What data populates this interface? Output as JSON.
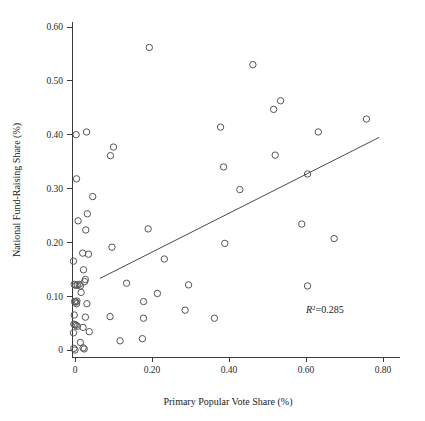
{
  "chart_data": {
    "type": "scatter",
    "title": "",
    "subtitle": "",
    "xlabel": "Primary Popular Vote Share (%)",
    "ylabel": "National Fund-Raising Share (%)",
    "xlim": [
      -0.035,
      0.82
    ],
    "ylim": [
      -0.022,
      0.625
    ],
    "grid": false,
    "legend": null,
    "xticks": [
      0,
      0.2,
      0.4,
      0.6,
      0.8
    ],
    "xtick_labels": [
      "0",
      "0.20",
      "0.40",
      "0.60",
      "0.80"
    ],
    "yticks": [
      0,
      0.1,
      0.2,
      0.3,
      0.4,
      0.5,
      0.6
    ],
    "ytick_labels": [
      "0",
      "0.10",
      "0.20",
      "0.30",
      "0.40",
      "0.50",
      "0.60"
    ],
    "annotations": [
      {
        "name": "r-squared",
        "text_prefix": "R",
        "text_superscript": "2",
        "text_suffix": "=0.285",
        "full_text": "R2=0.285",
        "x": 0.6,
        "y": 0.068
      }
    ],
    "trendline": {
      "type": "linear-fit",
      "r_squared": 0.285,
      "x_start": 0.065,
      "y_start": 0.133,
      "x_end": 0.79,
      "y_end": 0.395
    },
    "marker": {
      "shape": "open-circle",
      "radius_px": 3.2,
      "stroke": "#555555",
      "fill": "none"
    },
    "points": [
      {
        "x": 0.003,
        "y": 0.4
      },
      {
        "x": 0.03,
        "y": 0.405
      },
      {
        "x": 0.193,
        "y": 0.562
      },
      {
        "x": 0.462,
        "y": 0.53
      },
      {
        "x": 0.516,
        "y": 0.447
      },
      {
        "x": 0.534,
        "y": 0.463
      },
      {
        "x": 0.378,
        "y": 0.414
      },
      {
        "x": 0.632,
        "y": 0.405
      },
      {
        "x": 0.757,
        "y": 0.429
      },
      {
        "x": 0.52,
        "y": 0.362
      },
      {
        "x": 0.386,
        "y": 0.34
      },
      {
        "x": 0.604,
        "y": 0.327
      },
      {
        "x": 0.428,
        "y": 0.298
      },
      {
        "x": 0.092,
        "y": 0.361
      },
      {
        "x": 0.1,
        "y": 0.377
      },
      {
        "x": 0.004,
        "y": 0.318
      },
      {
        "x": 0.046,
        "y": 0.285
      },
      {
        "x": 0.032,
        "y": 0.253
      },
      {
        "x": 0.008,
        "y": 0.24
      },
      {
        "x": 0.028,
        "y": 0.223
      },
      {
        "x": 0.19,
        "y": 0.225
      },
      {
        "x": 0.589,
        "y": 0.234
      },
      {
        "x": 0.673,
        "y": 0.207
      },
      {
        "x": 0.389,
        "y": 0.198
      },
      {
        "x": 0.096,
        "y": 0.191
      },
      {
        "x": 0.02,
        "y": 0.18
      },
      {
        "x": 0.035,
        "y": 0.178
      },
      {
        "x": 0.232,
        "y": 0.169
      },
      {
        "x": -0.004,
        "y": 0.165
      },
      {
        "x": 0.022,
        "y": 0.149
      },
      {
        "x": 0.027,
        "y": 0.131
      },
      {
        "x": 0.025,
        "y": 0.127
      },
      {
        "x": 0.134,
        "y": 0.124
      },
      {
        "x": 0.295,
        "y": 0.121
      },
      {
        "x": 0.604,
        "y": 0.119
      },
      {
        "x": -0.002,
        "y": 0.122
      },
      {
        "x": 0.002,
        "y": 0.12
      },
      {
        "x": 0.006,
        "y": 0.121
      },
      {
        "x": 0.011,
        "y": 0.122
      },
      {
        "x": 0.014,
        "y": 0.119
      },
      {
        "x": 0.214,
        "y": 0.105
      },
      {
        "x": 0.016,
        "y": 0.107
      },
      {
        "x": 0.178,
        "y": 0.09
      },
      {
        "x": -0.001,
        "y": 0.09
      },
      {
        "x": 0.002,
        "y": 0.089
      },
      {
        "x": 0.005,
        "y": 0.091
      },
      {
        "x": 0.004,
        "y": 0.086
      },
      {
        "x": 0.031,
        "y": 0.086
      },
      {
        "x": 0.286,
        "y": 0.074
      },
      {
        "x": -0.002,
        "y": 0.065
      },
      {
        "x": 0.027,
        "y": 0.061
      },
      {
        "x": 0.091,
        "y": 0.062
      },
      {
        "x": 0.178,
        "y": 0.059
      },
      {
        "x": 0.362,
        "y": 0.059
      },
      {
        "x": -0.003,
        "y": 0.048
      },
      {
        "x": 0.0,
        "y": 0.047
      },
      {
        "x": 0.003,
        "y": 0.046
      },
      {
        "x": 0.006,
        "y": 0.044
      },
      {
        "x": 0.021,
        "y": 0.042
      },
      {
        "x": 0.037,
        "y": 0.034
      },
      {
        "x": -0.004,
        "y": 0.032
      },
      {
        "x": 0.014,
        "y": 0.014
      },
      {
        "x": 0.117,
        "y": 0.017
      },
      {
        "x": 0.175,
        "y": 0.021
      },
      {
        "x": -0.003,
        "y": 0.003
      },
      {
        "x": 0.0,
        "y": 0.0
      },
      {
        "x": 0.021,
        "y": 0.004
      },
      {
        "x": 0.024,
        "y": 0.002
      }
    ]
  },
  "axes": {
    "x_title": "Primary Popular Vote Share (%)",
    "y_title": "National Fund-Raising Share (%)"
  }
}
